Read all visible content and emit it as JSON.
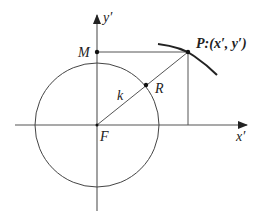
{
  "diagram": {
    "type": "geometry",
    "labels": {
      "y_axis": "y′",
      "x_axis": "x′",
      "origin": "F",
      "point_M": "M",
      "point_P": "P:(x′, y′)",
      "point_R": "R",
      "radius": "k"
    },
    "colors": {
      "line": "#333333",
      "background": "#ffffff"
    },
    "geometry": {
      "origin": [
        97,
        125
      ],
      "circle_radius": 62,
      "M": [
        97,
        52
      ],
      "P": [
        188,
        52
      ],
      "R": [
        146,
        85
      ]
    }
  }
}
